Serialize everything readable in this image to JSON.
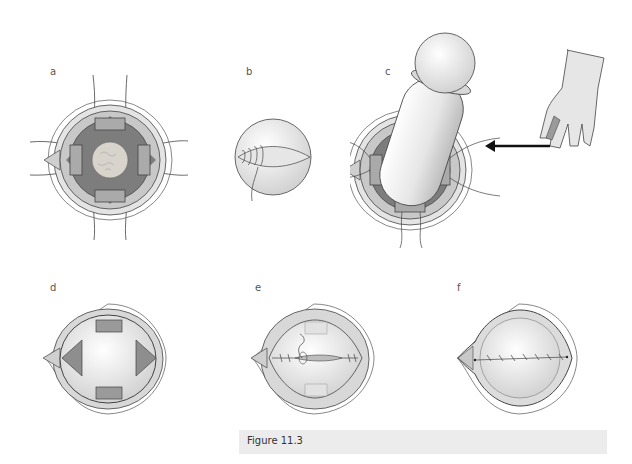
{
  "figure": {
    "caption": "Figure 11.3",
    "colors": {
      "dark_tissue": "#7d7d7d",
      "mid_tissue": "#bdbdbd",
      "light_tissue": "#dcdcdc",
      "lens": "#e8e8e8",
      "outline": "#444444",
      "caption_bg": "#ececec"
    },
    "panels": [
      {
        "label": "a",
        "description": "Eye with four retractors, opaque cataract in center"
      },
      {
        "label": "b",
        "description": "Sphere with sutured incision"
      },
      {
        "label": "c",
        "description": "Cylindrical device inserted, arrow from gloved hand with finger cot"
      },
      {
        "label": "d",
        "description": "Eye with four sutured retractors, clear sphere"
      },
      {
        "label": "e",
        "description": "Incision being closed with sutures"
      },
      {
        "label": "f",
        "description": "Closed eye with continuous suture line"
      }
    ]
  }
}
